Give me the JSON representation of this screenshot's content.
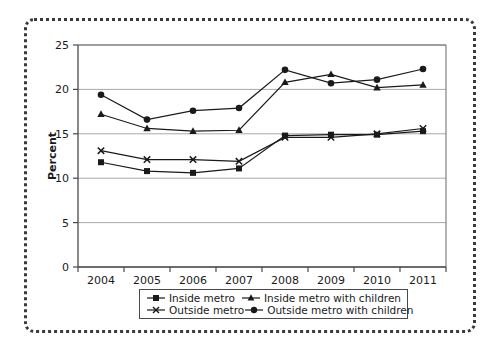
{
  "chart_data": {
    "type": "line",
    "title": "",
    "xlabel": "",
    "ylabel": "Percent",
    "categories": [
      "2004",
      "2005",
      "2006",
      "2007",
      "2008",
      "2009",
      "2010",
      "2011"
    ],
    "ylim": [
      0,
      25
    ],
    "yticks": [
      0,
      5,
      10,
      15,
      20,
      25
    ],
    "ytick_labels": [
      "0",
      "5",
      "10",
      "15",
      "20",
      "25"
    ],
    "grid": true,
    "grid_axis": "y",
    "legend_position": "bottom-center",
    "series": [
      {
        "name": "Inside metro",
        "marker": "square",
        "color": "#1a1a1a",
        "values": [
          11.8,
          10.8,
          10.6,
          11.1,
          14.8,
          14.9,
          14.9,
          15.3
        ]
      },
      {
        "name": "Inside metro with children",
        "marker": "triangle",
        "color": "#1a1a1a",
        "values": [
          17.2,
          15.6,
          15.3,
          15.4,
          20.8,
          21.7,
          20.2,
          20.5
        ]
      },
      {
        "name": "Outside metro",
        "marker": "x",
        "color": "#1a1a1a",
        "values": [
          13.1,
          12.1,
          12.1,
          11.9,
          14.6,
          14.6,
          15.0,
          15.6
        ]
      },
      {
        "name": "Outside metro with children",
        "marker": "circle",
        "color": "#1a1a1a",
        "values": [
          19.4,
          16.6,
          17.6,
          17.9,
          22.2,
          20.7,
          21.1,
          22.3
        ]
      }
    ]
  },
  "axis": {
    "y_title": "Percent"
  },
  "legend": {
    "items": [
      {
        "label": "Inside metro",
        "marker": "square"
      },
      {
        "label": "Inside metro with children",
        "marker": "triangle"
      },
      {
        "label": "Outside metro",
        "marker": "x"
      },
      {
        "label": "Outside metro with children",
        "marker": "circle"
      }
    ]
  },
  "colors": {
    "ink": "#1a1a1a",
    "grid": "#a8a8a8",
    "frame": "#6b6b6b",
    "dotted_border": "#3a3a3a"
  }
}
